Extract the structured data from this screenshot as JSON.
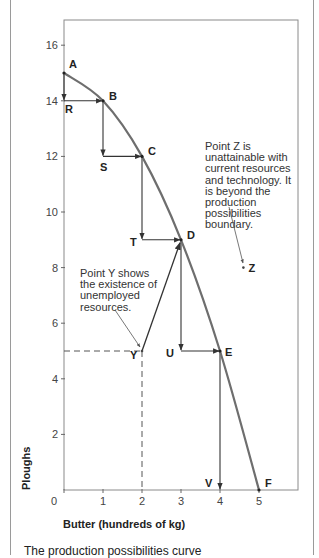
{
  "chart_data": {
    "type": "line",
    "title": "",
    "xlabel": "Butter (hundreds of kg)",
    "ylabel": "Ploughs",
    "xlim": [
      0,
      6
    ],
    "ylim": [
      0,
      17
    ],
    "x_ticks": [
      0,
      1,
      2,
      3,
      4,
      5
    ],
    "y_ticks": [
      2,
      4,
      6,
      8,
      10,
      12,
      14,
      16
    ],
    "grid": false,
    "series": [
      {
        "name": "Production possibilities boundary",
        "points": [
          {
            "label": "A",
            "x": 0,
            "y": 15
          },
          {
            "label": "B",
            "x": 1,
            "y": 14
          },
          {
            "label": "C",
            "x": 2,
            "y": 12
          },
          {
            "label": "D",
            "x": 3,
            "y": 9
          },
          {
            "label": "E",
            "x": 4,
            "y": 5
          },
          {
            "label": "F",
            "x": 5,
            "y": 0
          }
        ]
      }
    ],
    "step_points": [
      {
        "label": "R",
        "x": 0,
        "y": 14
      },
      {
        "label": "S",
        "x": 1,
        "y": 12
      },
      {
        "label": "T",
        "x": 2,
        "y": 9
      },
      {
        "label": "U",
        "x": 3,
        "y": 5
      },
      {
        "label": "V",
        "x": 4,
        "y": 0
      }
    ],
    "other_points": [
      {
        "label": "Y",
        "x": 2,
        "y": 5,
        "meaning": "unemployed resources"
      },
      {
        "label": "Z",
        "x": 4.6,
        "y": 8,
        "meaning": "unattainable"
      }
    ],
    "annotations": [
      {
        "target": "Y",
        "lines": [
          "Point Y shows",
          "the existence of",
          "unemployed",
          "resources."
        ]
      },
      {
        "target": "Z",
        "lines": [
          "Point Z is",
          "unattainable with",
          "current resources",
          "and technology. It",
          "is beyond the",
          "production",
          "possibilities",
          "boundary."
        ]
      }
    ]
  },
  "caption": "The production possibilities curve"
}
